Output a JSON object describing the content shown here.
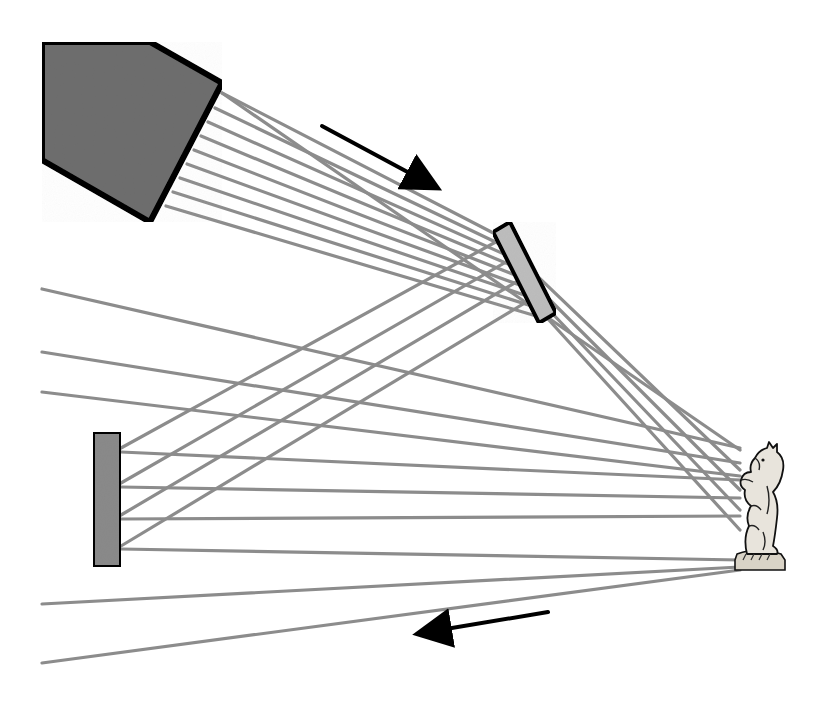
{
  "diagram": {
    "title": "",
    "colors": {
      "background": "#ffffff",
      "source_fill": "#6e6e6e",
      "outline": "#000000",
      "mirror_top_fill": "#bdbdbd",
      "mirror_left_fill": "#8a8a8a",
      "ray": "#8c8c8c",
      "arrow": "#000000",
      "object_fill": "#e8e4dc"
    },
    "components": [
      {
        "id": "laser-source",
        "shape": "pentagon",
        "points": [
          [
            42,
            42
          ],
          [
            150,
            42
          ],
          [
            222,
            83
          ],
          [
            150,
            222
          ],
          [
            42,
            160
          ]
        ]
      },
      {
        "id": "mirror-top",
        "shape": "tilted-rect",
        "points": [
          [
            493,
            232
          ],
          [
            510,
            222
          ],
          [
            556,
            313
          ],
          [
            539,
            323
          ]
        ]
      },
      {
        "id": "mirror-left",
        "shape": "rect",
        "x": 93,
        "y": 432,
        "w": 28,
        "h": 135
      },
      {
        "id": "object-knight",
        "shape": "chess-knight",
        "x": 733,
        "y": 442,
        "w": 52,
        "h": 130
      }
    ],
    "arrows": [
      {
        "id": "arrow-incident",
        "from": [
          322,
          126
        ],
        "to": [
          428,
          183
        ]
      },
      {
        "id": "arrow-return",
        "from": [
          548,
          612
        ],
        "to": [
          428,
          632
        ]
      }
    ],
    "rays": {
      "source_to_mirror": [
        [
          [
            222,
            93
          ],
          [
            503,
            238
          ]
        ],
        [
          [
            215,
            108
          ],
          [
            508,
            248
          ]
        ],
        [
          [
            208,
            122
          ],
          [
            513,
            258
          ]
        ],
        [
          [
            201,
            136
          ],
          [
            518,
            268
          ]
        ],
        [
          [
            194,
            150
          ],
          [
            523,
            278
          ]
        ],
        [
          [
            187,
            164
          ],
          [
            528,
            288
          ]
        ],
        [
          [
            180,
            178
          ],
          [
            533,
            298
          ]
        ],
        [
          [
            173,
            192
          ],
          [
            538,
            308
          ]
        ],
        [
          [
            166,
            206
          ],
          [
            543,
            318
          ]
        ]
      ],
      "mirror_to_left": [
        [
          [
            503,
            238
          ],
          [
            121,
            448
          ]
        ],
        [
          [
            513,
            258
          ],
          [
            121,
            483
          ]
        ],
        [
          [
            523,
            278
          ],
          [
            121,
            515
          ]
        ],
        [
          [
            533,
            298
          ],
          [
            121,
            546
          ]
        ]
      ],
      "mirror_to_object": [
        [
          [
            508,
            248
          ],
          [
            740,
            470
          ]
        ],
        [
          [
            518,
            268
          ],
          [
            740,
            490
          ]
        ],
        [
          [
            528,
            288
          ],
          [
            740,
            510
          ]
        ],
        [
          [
            538,
            308
          ],
          [
            740,
            530
          ]
        ]
      ],
      "left_mirror_to_object": [
        [
          [
            121,
            452
          ],
          [
            740,
            480
          ]
        ],
        [
          [
            121,
            487
          ],
          [
            740,
            498
          ]
        ],
        [
          [
            121,
            519
          ],
          [
            740,
            516
          ]
        ],
        [
          [
            121,
            549
          ],
          [
            740,
            560
          ]
        ]
      ],
      "edge_to_object": [
        [
          [
            42,
            289
          ],
          [
            740,
            448
          ]
        ],
        [
          [
            42,
            352
          ],
          [
            740,
            463
          ]
        ],
        [
          [
            42,
            392
          ],
          [
            740,
            476
          ]
        ],
        [
          [
            42,
            604
          ],
          [
            740,
            567
          ]
        ],
        [
          [
            42,
            663
          ],
          [
            740,
            570
          ]
        ]
      ],
      "source_to_object": [
        [
          [
            222,
            93
          ],
          [
            740,
            450
          ]
        ]
      ]
    }
  }
}
